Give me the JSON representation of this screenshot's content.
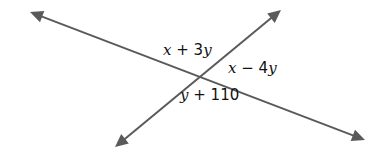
{
  "diagram": {
    "type": "intersecting-lines",
    "colors": {
      "line": "#5a5a5a",
      "text": "#111111",
      "background": "#ffffff"
    },
    "intersection": {
      "x": 200,
      "y": 76
    },
    "lines": [
      {
        "name": "line-1",
        "from": {
          "x": 30,
          "y": 12
        },
        "to": {
          "x": 365,
          "y": 140
        },
        "arrows": [
          "start",
          "end"
        ]
      },
      {
        "name": "line-2",
        "from": {
          "x": 115,
          "y": 147
        },
        "to": {
          "x": 281,
          "y": 10
        },
        "arrows": [
          "start",
          "end"
        ]
      }
    ],
    "angle_labels": [
      {
        "position": "top",
        "text": "x + 3y",
        "parts": {
          "v1": "x",
          "op": " + 3",
          "v2": "y",
          "tail": ""
        },
        "x": 163,
        "y": 55
      },
      {
        "position": "right",
        "text": "x − 4y",
        "parts": {
          "v1": "x",
          "op": " − 4",
          "v2": "y",
          "tail": ""
        },
        "x": 228,
        "y": 73
      },
      {
        "position": "bottom",
        "text": "y + 110",
        "parts": {
          "v1": "y",
          "op": " + 110",
          "v2": "",
          "tail": ""
        },
        "x": 180,
        "y": 100
      }
    ]
  }
}
